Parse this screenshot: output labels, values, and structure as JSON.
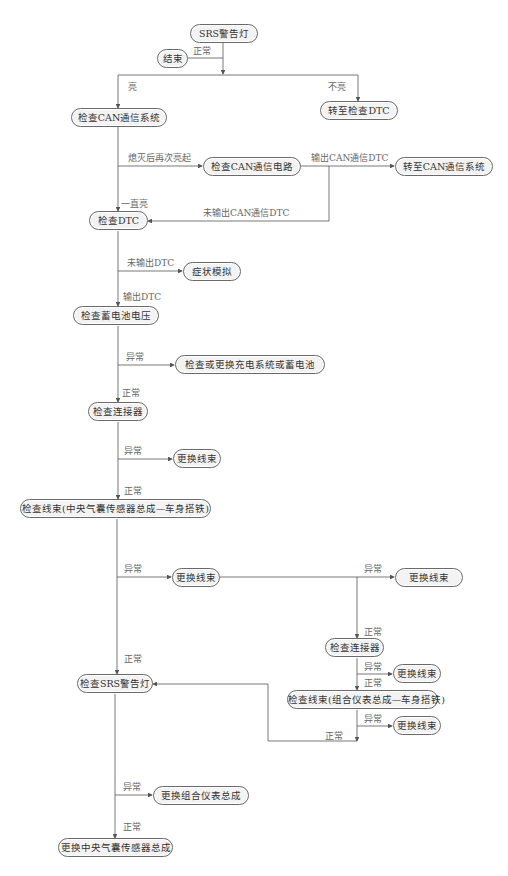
{
  "diagram": {
    "nodes": {
      "start": "SRS警告灯",
      "end": "结束",
      "check_can_system": "检查CAN通信系统",
      "goto_check_dtc": "转至检查DTC",
      "check_can_circuit": "检查CAN通信电路",
      "goto_can_system": "转至CAN通信系统",
      "check_dtc": "检查DTC",
      "symptom_simulation": "症状模拟",
      "check_battery_voltage": "检查蓄电池电压",
      "check_replace_charging": "检查或更换充电系统或蓄电池",
      "check_connector_1": "检查连接器",
      "replace_harness_1": "更换线束",
      "check_harness_airbag": "检查线束(中央气囊传感器总成—车身搭铁)",
      "replace_harness_2": "更换线束",
      "replace_harness_3": "更换线束",
      "check_connector_2": "检查连接器",
      "replace_harness_4": "更换线束",
      "check_harness_meter": "检查线束(组合仪表总成—车身搭铁)",
      "replace_harness_5": "更换线束",
      "check_srs_light": "检查SRS警告灯",
      "replace_meter": "更换组合仪表总成",
      "replace_airbag_sensor": "更换中央气囊传感器总成"
    },
    "edge_labels": {
      "start_normal": "正常",
      "lit": "亮",
      "not_lit": "不亮",
      "relit_after_off": "熄灭后再次亮起",
      "output_can_dtc": "输出CAN通信DTC",
      "always_lit": "一直亮",
      "no_can_dtc": "未输出CAN通信DTC",
      "no_dtc": "未输出DTC",
      "output_dtc": "输出DTC",
      "battery_abnormal": "异常",
      "battery_normal": "正常",
      "connector1_abnormal": "异常",
      "connector1_normal": "正常",
      "harness_abnormal": "异常",
      "harness_normal": "正常",
      "harness2_abnormal": "异常",
      "connector2_normal": "正常",
      "connector2_abnormal": "异常",
      "connector2_to_harness_normal": "正常",
      "meter_harness_abnormal": "异常",
      "meter_harness_normal": "正常",
      "srs_abnormal": "异常",
      "srs_normal": "正常"
    },
    "colors": {
      "node_fill": "#f3f3f3",
      "node_border": "#6a6a6a",
      "line": "#555555",
      "label_text": "#666666"
    }
  }
}
